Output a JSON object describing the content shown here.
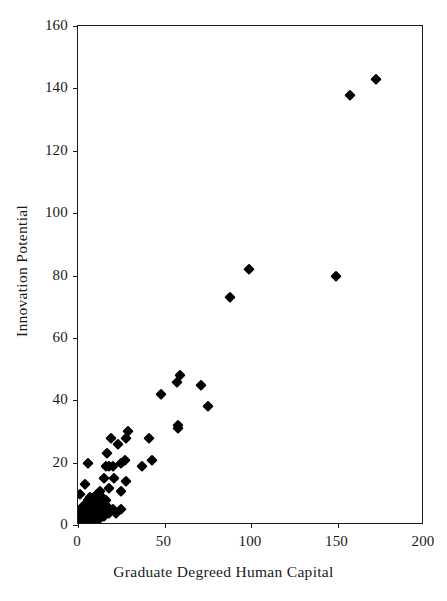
{
  "chart_data": {
    "type": "scatter",
    "title": "",
    "xlabel": "Graduate Degreed Human Capital",
    "ylabel": "Innovation Potential",
    "xlim": [
      0,
      200
    ],
    "ylim": [
      0,
      160
    ],
    "xticks": [
      0,
      50,
      100,
      150,
      200
    ],
    "yticks": [
      0,
      20,
      40,
      60,
      80,
      100,
      120,
      140,
      160
    ],
    "xtick_labels": [
      "0",
      "50",
      "100",
      "150",
      "200"
    ],
    "ytick_labels": [
      "0",
      "20",
      "40",
      "60",
      "80",
      "100",
      "120",
      "140",
      "160"
    ],
    "grid": false,
    "legend": null,
    "marker": {
      "shape": "diamond",
      "color": "#000000",
      "size": 7.6
    },
    "series": [
      {
        "name": "observations",
        "points": [
          [
            172,
            143
          ],
          [
            157,
            138
          ],
          [
            149,
            80
          ],
          [
            99,
            82
          ],
          [
            88,
            73
          ],
          [
            71,
            45
          ],
          [
            75,
            38
          ],
          [
            59,
            48
          ],
          [
            57,
            46
          ],
          [
            48,
            42
          ],
          [
            58,
            32
          ],
          [
            58,
            31
          ],
          [
            29,
            30
          ],
          [
            28,
            28
          ],
          [
            19,
            28
          ],
          [
            41,
            28
          ],
          [
            23,
            26
          ],
          [
            17,
            23
          ],
          [
            27,
            21
          ],
          [
            43,
            21
          ],
          [
            25,
            20
          ],
          [
            6,
            20
          ],
          [
            18,
            19
          ],
          [
            20,
            19
          ],
          [
            16,
            19
          ],
          [
            37,
            19
          ],
          [
            15,
            15
          ],
          [
            21,
            15
          ],
          [
            28,
            14
          ],
          [
            4,
            13
          ],
          [
            18,
            12
          ],
          [
            13,
            11
          ],
          [
            25,
            11
          ],
          [
            1,
            10
          ],
          [
            11,
            10
          ],
          [
            9,
            9
          ],
          [
            14,
            9
          ],
          [
            7,
            9
          ],
          [
            12,
            8
          ],
          [
            16,
            8
          ],
          [
            10,
            8
          ],
          [
            6,
            8
          ],
          [
            8,
            7
          ],
          [
            13,
            7
          ],
          [
            5,
            7
          ],
          [
            11,
            6
          ],
          [
            17,
            6
          ],
          [
            3,
            6
          ],
          [
            7,
            6
          ],
          [
            9,
            6
          ],
          [
            15,
            5
          ],
          [
            20,
            5
          ],
          [
            25,
            5
          ],
          [
            4,
            5
          ],
          [
            6,
            5
          ],
          [
            10,
            5
          ],
          [
            12,
            5
          ],
          [
            2,
            5
          ],
          [
            8,
            4
          ],
          [
            14,
            4
          ],
          [
            18,
            4
          ],
          [
            22,
            4
          ],
          [
            5,
            4
          ],
          [
            3,
            4
          ],
          [
            9,
            4
          ],
          [
            11,
            4
          ],
          [
            7,
            3
          ],
          [
            13,
            3
          ],
          [
            1,
            3
          ],
          [
            4,
            3
          ],
          [
            6,
            3
          ],
          [
            10,
            3
          ],
          [
            2,
            3
          ],
          [
            8,
            3
          ],
          [
            15,
            3
          ],
          [
            5,
            2
          ],
          [
            3,
            2
          ],
          [
            7,
            2
          ],
          [
            9,
            2
          ],
          [
            11,
            2
          ],
          [
            1,
            2
          ],
          [
            4,
            2
          ],
          [
            6,
            2
          ],
          [
            2,
            2
          ],
          [
            12,
            2
          ],
          [
            8,
            2
          ],
          [
            3,
            1
          ],
          [
            5,
            1
          ],
          [
            7,
            1
          ],
          [
            1,
            1
          ],
          [
            2,
            1
          ],
          [
            4,
            1
          ],
          [
            6,
            1
          ],
          [
            9,
            1
          ],
          [
            10,
            1
          ],
          [
            2,
            0.5
          ],
          [
            4,
            0.5
          ],
          [
            1,
            0.5
          ],
          [
            3,
            0.5
          ],
          [
            5,
            0.5
          ],
          [
            6,
            0.5
          ],
          [
            7,
            0.5
          ]
        ]
      }
    ]
  }
}
